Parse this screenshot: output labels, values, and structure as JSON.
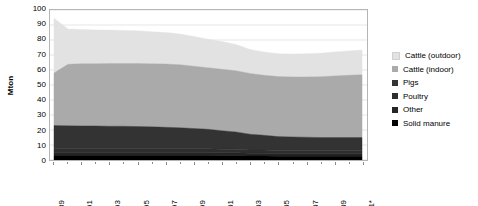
{
  "chart_data": {
    "type": "area",
    "stacked": true,
    "title": "",
    "xlabel": "",
    "ylabel": "Mton",
    "ylim": [
      0,
      100
    ],
    "ytick_step": 10,
    "ytick_labels": [
      "100",
      "90",
      "80",
      "70",
      "60",
      "50",
      "40",
      "30",
      "20",
      "10",
      "0"
    ],
    "grid": true,
    "legend_position": "right",
    "x": [
      1989,
      1990,
      1991,
      1992,
      1993,
      1994,
      1995,
      1996,
      1997,
      1998,
      1999,
      2000,
      2001,
      2002,
      2003,
      2004,
      2005,
      2006,
      2007,
      2008,
      2009,
      2010,
      2011
    ],
    "xtick_labels": [
      "1989",
      "1991",
      "1993",
      "1995",
      "1997",
      "1999",
      "2001",
      "2003",
      "2005",
      "2007",
      "2009",
      "2011*"
    ],
    "series": [
      {
        "name": "Solid manure",
        "color": "#000000",
        "values": [
          3.0,
          3.0,
          3.0,
          3.0,
          3.0,
          3.0,
          3.0,
          3.0,
          3.0,
          3.0,
          3.0,
          3.0,
          2.8,
          2.8,
          2.6,
          2.6,
          2.5,
          2.5,
          2.5,
          2.5,
          2.5,
          2.5,
          2.5
        ]
      },
      {
        "name": "Other",
        "color": "#242424",
        "values": [
          2.0,
          2.0,
          2.0,
          2.0,
          2.0,
          2.0,
          2.0,
          2.0,
          2.0,
          2.0,
          2.0,
          2.0,
          2.0,
          2.0,
          1.9,
          1.9,
          1.8,
          1.8,
          1.8,
          1.8,
          1.8,
          1.8,
          1.8
        ]
      },
      {
        "name": "Poultry",
        "color": "#2e2e2e",
        "values": [
          2.5,
          2.5,
          2.5,
          2.5,
          2.5,
          2.5,
          2.5,
          2.5,
          2.5,
          2.5,
          2.5,
          2.5,
          2.4,
          2.4,
          2.2,
          2.2,
          2.1,
          2.1,
          2.1,
          2.1,
          2.1,
          2.1,
          2.1
        ]
      },
      {
        "name": "Pigs",
        "color": "#333333",
        "values": [
          15.5,
          15.3,
          15.2,
          15.2,
          15.0,
          15.0,
          14.8,
          14.6,
          14.3,
          14.0,
          13.5,
          13.0,
          12.3,
          11.5,
          10.5,
          9.8,
          9.2,
          9.0,
          8.8,
          8.6,
          8.6,
          8.6,
          8.6
        ]
      },
      {
        "name": "Cattle (indoor)",
        "color": "#aaaaaa",
        "values": [
          35.0,
          41.0,
          41.5,
          41.5,
          41.8,
          41.8,
          42.0,
          42.0,
          42.2,
          42.0,
          41.5,
          41.0,
          41.0,
          40.8,
          40.5,
          40.0,
          40.0,
          40.0,
          40.2,
          40.5,
          41.0,
          41.5,
          41.8
        ]
      },
      {
        "name": "Cattle (outdoor)",
        "color": "#e2e2e2",
        "values": [
          36.5,
          23.5,
          22.8,
          22.5,
          22.3,
          22.0,
          21.8,
          21.4,
          21.0,
          20.5,
          19.8,
          19.0,
          18.5,
          17.5,
          16.0,
          15.5,
          15.3,
          15.3,
          15.5,
          15.7,
          16.0,
          16.2,
          16.5
        ]
      }
    ],
    "totals": [
      94.5,
      87.3,
      87.0,
      86.7,
      86.6,
      86.3,
      86.1,
      85.5,
      85.0,
      84.0,
      82.3,
      80.5,
      79.0,
      77.0,
      73.7,
      72.0,
      70.9,
      70.7,
      70.9,
      71.2,
      72.0,
      72.7,
      73.3
    ]
  },
  "axis": {
    "y_title": "Mton"
  },
  "legend": {
    "items": [
      {
        "label": "Cattle (outdoor)",
        "color": "#e2e2e2"
      },
      {
        "label": "Cattle (indoor)",
        "color": "#aaaaaa"
      },
      {
        "label": "Pigs",
        "color": "#333333"
      },
      {
        "label": "Poultry",
        "color": "#2e2e2e"
      },
      {
        "label": "Other",
        "color": "#242424"
      },
      {
        "label": "Solid manure",
        "color": "#000000"
      }
    ]
  }
}
